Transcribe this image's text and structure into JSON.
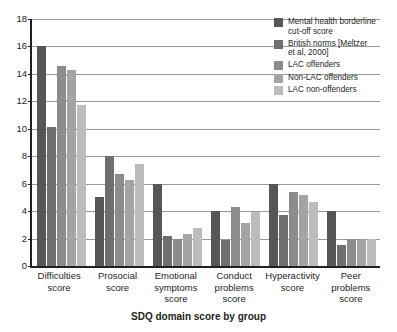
{
  "chart_data": {
    "type": "bar",
    "title": "SDQ domain score by group",
    "xlabel": "SDQ domain score by group",
    "ylabel": "",
    "ylim": [
      0,
      18
    ],
    "ytick_step": 2,
    "yticks": [
      0,
      2,
      4,
      6,
      8,
      10,
      12,
      14,
      16,
      18
    ],
    "grid": "horizontal",
    "legend_position": "top-right",
    "categories": [
      "Difficulties score",
      "Prosocial score",
      "Emotional symptoms score",
      "Conduct problems score",
      "Hyperactivity score",
      "Peer problems score"
    ],
    "category_lines": [
      [
        "Difficulties",
        "score"
      ],
      [
        "Prosocial",
        "score"
      ],
      [
        "Emotional",
        "symptoms",
        "score"
      ],
      [
        "Conduct",
        "problems",
        "score"
      ],
      [
        "Hyperactivity",
        "score"
      ],
      [
        "Peer",
        "problems",
        "score"
      ]
    ],
    "series": [
      {
        "name": "Mental health borderline cut-off score",
        "name_lines": [
          "Mental health borderline",
          "cut-off score"
        ],
        "color": "#565656",
        "values": [
          16,
          5,
          6,
          4,
          6,
          4
        ]
      },
      {
        "name": "British norms (Meltzer et al, 2000)",
        "name_lines": [
          "British norms [Meltzer",
          "et al, 2000]"
        ],
        "color": "#6f6f6f",
        "values": [
          10.1,
          8,
          2.2,
          1.9,
          3.7,
          1.5
        ]
      },
      {
        "name": "LAC offenders",
        "name_lines": [
          "LAC offenders"
        ],
        "color": "#8c8c8c",
        "values": [
          14.6,
          6.7,
          2.0,
          4.3,
          5.4,
          2.0
        ]
      },
      {
        "name": "Non-LAC offenders",
        "name_lines": [
          "Non-LAC offenders"
        ],
        "color": "#a4a4a4",
        "values": [
          14.3,
          6.3,
          2.3,
          3.1,
          5.2,
          1.9
        ]
      },
      {
        "name": "LAC non-offenders",
        "name_lines": [
          "LAC non-offenders"
        ],
        "color": "#bcbcbc",
        "values": [
          11.7,
          7.4,
          2.8,
          3.9,
          4.7,
          2.0
        ]
      }
    ]
  }
}
